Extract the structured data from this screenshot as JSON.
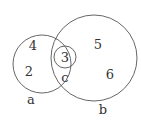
{
  "diagram": {
    "type": "venn",
    "sets": [
      {
        "id": "a",
        "label": "a",
        "elements": [
          "4",
          "2"
        ]
      },
      {
        "id": "b",
        "label": "b",
        "elements": [
          "5",
          "6"
        ]
      },
      {
        "id": "c",
        "label": "c",
        "elements": [
          "3"
        ]
      }
    ],
    "labels": {
      "a": "a",
      "b": "b",
      "c": "c",
      "n4": "4",
      "n2": "2",
      "n3": "3",
      "n5": "5",
      "n6": "6"
    },
    "stroke_color": "#555555"
  }
}
